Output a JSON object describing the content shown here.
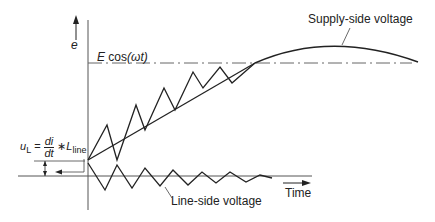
{
  "diagram": {
    "title": "",
    "colors": {
      "line": "#222222",
      "axis": "#555555",
      "dashdot": "#666666",
      "background": "#ffffff"
    },
    "axis": {
      "y_label": "e",
      "x_label": "Time"
    },
    "reference_line": {
      "label_prefix": "E",
      "label_func": "cos",
      "label_arg": "(ωt)",
      "style": "dash-dot"
    },
    "annotations": {
      "supply": "Supply-side voltage",
      "line_side": "Line-side voltage",
      "ul_symbol": "u",
      "ul_sub": "L",
      "ul_eq": "=",
      "ul_num": "di",
      "ul_den": "dt",
      "ul_times": "∗",
      "ul_L": "L",
      "ul_L_sub": "line"
    }
  }
}
